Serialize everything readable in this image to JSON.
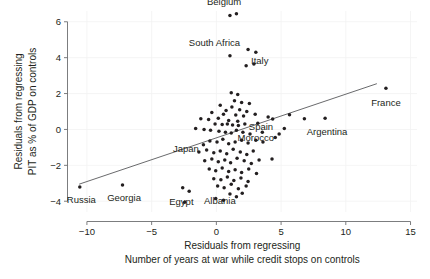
{
  "chart_data": {
    "type": "scatter",
    "title": "",
    "xlabel": "Residuals from regressing\nNumber of years at war while credit stops on controls",
    "xlabel_line1": "Residuals from regressing",
    "xlabel_line2": "Number of years at war while credit stops on controls",
    "ylabel": "Residuals from regressing\nPIT as % of GDP on controls",
    "ylabel_line1": "Residuals from regressing",
    "ylabel_line2": "PIT as % of GDP on controls",
    "xlim": [
      -11.5,
      15.5
    ],
    "ylim": [
      -4.6,
      6.6
    ],
    "xticks": [
      -10,
      -5,
      0,
      5,
      10,
      15
    ],
    "xtick_labels": [
      "−10",
      "−5",
      "0",
      "5",
      "10",
      "15"
    ],
    "yticks": [
      -4,
      -2,
      0,
      2,
      4,
      6
    ],
    "ytick_labels": [
      "−4",
      "−2",
      "0",
      "2",
      "4",
      "6"
    ],
    "grid": true,
    "legend": "none",
    "point_color": "#231f20",
    "line_color": "#58595b",
    "axis_color": "#6d6e71",
    "trend_line": {
      "x0": -10.6,
      "y0": -3.05,
      "x1": 12.4,
      "y1": 2.55
    },
    "annotations": [
      {
        "label": "Belgium",
        "x": 1.05,
        "y": 6.35,
        "label_dx": -0.45,
        "label_dy": -0.78
      },
      {
        "label": "South Africa",
        "x": 1.1,
        "y": 4.1,
        "label_dx": -1.25,
        "label_dy": -0.72
      },
      {
        "label": "Italy",
        "x": 2.9,
        "y": 3.65,
        "label_dx": 0.45,
        "label_dy": -0.2
      },
      {
        "label": "Spain",
        "x": 4.0,
        "y": 0.7,
        "label_dx": -0.55,
        "label_dy": 0.55
      },
      {
        "label": "Morocco",
        "x": 3.2,
        "y": 0.35,
        "label_dx": -0.15,
        "label_dy": 0.8
      },
      {
        "label": "France",
        "x": 13.1,
        "y": 2.3,
        "label_dx": 0.0,
        "label_dy": 0.78
      },
      {
        "label": "Argentina",
        "x": 8.4,
        "y": 0.62,
        "label_dx": 0.15,
        "label_dy": 0.72
      },
      {
        "label": "Japan",
        "x": -1.0,
        "y": -0.85,
        "label_dx": -1.35,
        "label_dy": 0.22
      },
      {
        "label": "Russia",
        "x": -10.55,
        "y": -3.2,
        "label_dx": 0.12,
        "label_dy": 0.72
      },
      {
        "label": "Georgia",
        "x": -7.25,
        "y": -3.1,
        "label_dx": 0.12,
        "label_dy": 0.72
      },
      {
        "label": "Egypt",
        "x": -2.6,
        "y": -3.25,
        "label_dx": -0.1,
        "label_dy": 0.78
      },
      {
        "label": "Albania",
        "x": -0.05,
        "y": -3.85,
        "label_dx": 0.32,
        "label_dy": 0.12
      }
    ],
    "points": [
      [
        1.05,
        6.35
      ],
      [
        1.55,
        6.45
      ],
      [
        1.05,
        4.1
      ],
      [
        2.45,
        4.45
      ],
      [
        3.05,
        4.3
      ],
      [
        2.9,
        3.65
      ],
      [
        2.3,
        3.55
      ],
      [
        1.15,
        2.05
      ],
      [
        1.65,
        1.95
      ],
      [
        1.4,
        1.6
      ],
      [
        1.95,
        1.5
      ],
      [
        2.55,
        1.45
      ],
      [
        0.3,
        1.35
      ],
      [
        1.2,
        1.25
      ],
      [
        1.8,
        1.1
      ],
      [
        0.75,
        1.05
      ],
      [
        2.35,
        1.0
      ],
      [
        -0.35,
        0.95
      ],
      [
        0.55,
        0.85
      ],
      [
        1.5,
        0.8
      ],
      [
        2.1,
        0.75
      ],
      [
        3.0,
        0.85
      ],
      [
        -1.2,
        0.6
      ],
      [
        -0.6,
        0.55
      ],
      [
        0.15,
        0.62
      ],
      [
        0.95,
        0.5
      ],
      [
        1.65,
        0.45
      ],
      [
        4.0,
        0.7
      ],
      [
        4.35,
        0.58
      ],
      [
        5.65,
        0.82
      ],
      [
        6.8,
        0.6
      ],
      [
        8.4,
        0.62
      ],
      [
        13.1,
        2.3
      ],
      [
        -0.1,
        0.3
      ],
      [
        0.45,
        0.28
      ],
      [
        0.85,
        0.3
      ],
      [
        1.25,
        0.25
      ],
      [
        1.7,
        0.22
      ],
      [
        2.2,
        0.3
      ],
      [
        3.2,
        0.35
      ],
      [
        -1.6,
        0.05
      ],
      [
        -0.95,
        0.0
      ],
      [
        -0.45,
        -0.05
      ],
      [
        0.2,
        -0.1
      ],
      [
        0.7,
        -0.15
      ],
      [
        1.15,
        -0.2
      ],
      [
        1.55,
        -0.05
      ],
      [
        2.05,
        -0.15
      ],
      [
        2.6,
        -0.25
      ],
      [
        -1.0,
        -0.85
      ],
      [
        -0.5,
        -0.65
      ],
      [
        0.05,
        -0.7
      ],
      [
        0.5,
        -0.55
      ],
      [
        0.95,
        -0.8
      ],
      [
        1.45,
        -0.7
      ],
      [
        1.95,
        -0.6
      ],
      [
        2.45,
        -0.75
      ],
      [
        3.05,
        -0.6
      ],
      [
        3.6,
        -0.7
      ],
      [
        4.55,
        -0.45
      ],
      [
        -1.35,
        -1.25
      ],
      [
        -0.75,
        -1.15
      ],
      [
        -0.2,
        -1.3
      ],
      [
        0.3,
        -1.2
      ],
      [
        0.8,
        -1.35
      ],
      [
        1.3,
        -1.1
      ],
      [
        1.85,
        -1.25
      ],
      [
        2.35,
        -1.4
      ],
      [
        2.85,
        -1.2
      ],
      [
        -0.9,
        -1.75
      ],
      [
        -0.35,
        -1.65
      ],
      [
        0.15,
        -1.8
      ],
      [
        0.65,
        -1.7
      ],
      [
        1.1,
        -1.85
      ],
      [
        1.6,
        -1.6
      ],
      [
        2.15,
        -1.75
      ],
      [
        2.7,
        -1.9
      ],
      [
        3.3,
        -1.7
      ],
      [
        4.3,
        -1.65
      ],
      [
        -0.55,
        -2.2
      ],
      [
        -0.05,
        -2.3
      ],
      [
        0.45,
        -2.15
      ],
      [
        0.95,
        -2.35
      ],
      [
        1.45,
        -2.25
      ],
      [
        1.95,
        -2.4
      ],
      [
        2.5,
        -2.2
      ],
      [
        3.1,
        -2.45
      ],
      [
        -0.2,
        -2.75
      ],
      [
        0.35,
        -2.8
      ],
      [
        0.85,
        -2.65
      ],
      [
        1.35,
        -2.85
      ],
      [
        1.9,
        -2.7
      ],
      [
        2.45,
        -2.9
      ],
      [
        0.1,
        -3.15
      ],
      [
        0.6,
        -3.25
      ],
      [
        1.15,
        -3.05
      ],
      [
        1.7,
        -3.3
      ],
      [
        2.3,
        -3.15
      ],
      [
        -2.6,
        -3.25
      ],
      [
        -2.45,
        -4.05
      ],
      [
        -2.1,
        -3.45
      ],
      [
        -0.05,
        -3.85
      ],
      [
        -10.55,
        -3.2
      ],
      [
        -7.25,
        -3.1
      ],
      [
        1.05,
        -3.6
      ],
      [
        1.55,
        -3.75
      ],
      [
        0.55,
        -3.95
      ],
      [
        2.0,
        -3.55
      ],
      [
        3.55,
        -0.15
      ],
      [
        4.85,
        -0.25
      ],
      [
        5.25,
        0.05
      ]
    ]
  }
}
